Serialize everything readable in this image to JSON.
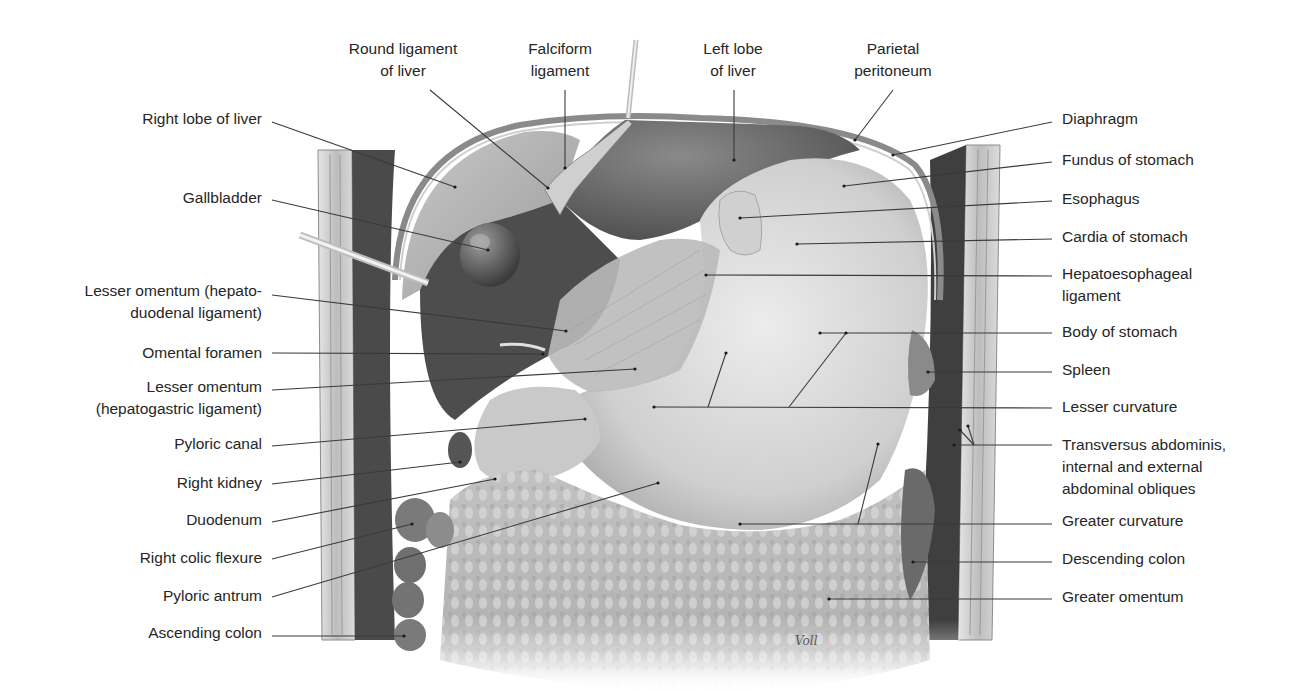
{
  "figure": {
    "signature": "Voll",
    "colors": {
      "background": "#ffffff",
      "label_text": "#262626",
      "leader_line": "#3a3a3a",
      "wall_light": "#d9d9d9",
      "wall_dark": "#3c3c3c",
      "liver": "#9a9a9a",
      "liver_dark": "#4a4a4a",
      "stomach": "#d4d4d4",
      "omentum": "#bdbdbd",
      "colon": "#6e6e6e"
    }
  },
  "labels": {
    "top": [
      {
        "id": "round-ligament-of-liver",
        "lines": [
          "Round ligament",
          "of liver"
        ],
        "x": 403,
        "y": 38,
        "anchor": [
          430,
          90
        ],
        "target": [
          548,
          188
        ]
      },
      {
        "id": "falciform-ligament",
        "lines": [
          "Falciform",
          "ligament"
        ],
        "x": 560,
        "y": 38,
        "anchor": [
          565,
          90
        ],
        "target": [
          565,
          168
        ]
      },
      {
        "id": "left-lobe-of-liver",
        "lines": [
          "Left lobe",
          "of liver"
        ],
        "x": 733,
        "y": 38,
        "anchor": [
          734,
          90
        ],
        "target": [
          734,
          160
        ]
      },
      {
        "id": "parietal-peritoneum",
        "lines": [
          "Parietal",
          "peritoneum"
        ],
        "x": 893,
        "y": 38,
        "anchor": [
          893,
          90
        ],
        "target": [
          855,
          140
        ]
      }
    ],
    "left": [
      {
        "id": "right-lobe-of-liver",
        "lines": [
          "Right lobe of liver"
        ],
        "right": 262,
        "y": 108,
        "anchor": [
          272,
          122
        ],
        "target": [
          455,
          187
        ]
      },
      {
        "id": "gallbladder",
        "lines": [
          "Gallbladder"
        ],
        "right": 262,
        "y": 187,
        "anchor": [
          272,
          200
        ],
        "target": [
          488,
          250
        ]
      },
      {
        "id": "lesser-omentum-hepatoduodenal",
        "lines": [
          "Lesser omentum (hepato-",
          "duodenal ligament)"
        ],
        "right": 262,
        "y": 280,
        "anchor": [
          272,
          295
        ],
        "target": [
          566,
          331
        ]
      },
      {
        "id": "omental-foramen",
        "lines": [
          "Omental foramen"
        ],
        "right": 262,
        "y": 342,
        "anchor": [
          272,
          353
        ],
        "target": [
          543,
          354
        ]
      },
      {
        "id": "lesser-omentum-hepatogastric",
        "lines": [
          "Lesser omentum",
          "(hepatogastric ligament)"
        ],
        "right": 262,
        "y": 376,
        "anchor": [
          272,
          390
        ],
        "target": [
          635,
          369
        ]
      },
      {
        "id": "pyloric-canal",
        "lines": [
          "Pyloric canal"
        ],
        "right": 262,
        "y": 433,
        "anchor": [
          272,
          446
        ],
        "target": [
          585,
          419
        ]
      },
      {
        "id": "right-kidney",
        "lines": [
          "Right kidney"
        ],
        "right": 262,
        "y": 472,
        "anchor": [
          272,
          484
        ],
        "target": [
          460,
          462
        ]
      },
      {
        "id": "duodenum",
        "lines": [
          "Duodenum"
        ],
        "right": 262,
        "y": 509,
        "anchor": [
          272,
          522
        ],
        "target": [
          495,
          479
        ]
      },
      {
        "id": "right-colic-flexure",
        "lines": [
          "Right colic flexure"
        ],
        "right": 262,
        "y": 547,
        "anchor": [
          272,
          559
        ],
        "target": [
          412,
          524
        ]
      },
      {
        "id": "pyloric-antrum",
        "lines": [
          "Pyloric antrum"
        ],
        "right": 262,
        "y": 585,
        "anchor": [
          272,
          597
        ],
        "target": [
          658,
          483
        ]
      },
      {
        "id": "ascending-colon",
        "lines": [
          "Ascending colon"
        ],
        "right": 262,
        "y": 622,
        "anchor": [
          272,
          636
        ],
        "target": [
          404,
          636
        ]
      }
    ],
    "right": [
      {
        "id": "diaphragm",
        "lines": [
          "Diaphragm"
        ],
        "x": 1062,
        "y": 108,
        "anchor": [
          1052,
          122
        ],
        "target": [
          893,
          155
        ]
      },
      {
        "id": "fundus-of-stomach",
        "lines": [
          "Fundus of stomach"
        ],
        "x": 1062,
        "y": 149,
        "anchor": [
          1052,
          162
        ],
        "target": [
          844,
          186
        ]
      },
      {
        "id": "esophagus",
        "lines": [
          "Esophagus"
        ],
        "x": 1062,
        "y": 188,
        "anchor": [
          1052,
          201
        ],
        "target": [
          740,
          218
        ]
      },
      {
        "id": "cardia-of-stomach",
        "lines": [
          "Cardia of stomach"
        ],
        "x": 1062,
        "y": 226,
        "anchor": [
          1052,
          239
        ],
        "target": [
          797,
          244
        ]
      },
      {
        "id": "hepatoesophageal-ligament",
        "lines": [
          "Hepatoesophageal",
          "ligament"
        ],
        "x": 1062,
        "y": 263,
        "anchor": [
          1052,
          276
        ],
        "target": [
          706,
          275
        ]
      },
      {
        "id": "body-of-stomach",
        "lines": [
          "Body of stomach"
        ],
        "x": 1062,
        "y": 321,
        "anchor": [
          1052,
          333
        ],
        "target": [
          820,
          333
        ]
      },
      {
        "id": "spleen",
        "lines": [
          "Spleen"
        ],
        "x": 1062,
        "y": 359,
        "anchor": [
          1052,
          372
        ],
        "target": [
          928,
          372
        ]
      },
      {
        "id": "lesser-curvature",
        "lines": [
          "Lesser curvature"
        ],
        "x": 1062,
        "y": 396,
        "anchor": [
          1052,
          408
        ],
        "target": [
          654,
          407
        ]
      },
      {
        "id": "transversus-abdominis-obliques",
        "lines": [
          "Transversus abdominis,",
          "internal and external",
          "abdominal obliques"
        ],
        "x": 1062,
        "y": 434,
        "anchor": [
          1052,
          445
        ],
        "target": [
          954,
          445
        ]
      },
      {
        "id": "greater-curvature",
        "lines": [
          "Greater curvature"
        ],
        "x": 1062,
        "y": 510,
        "anchor": [
          1052,
          524
        ],
        "target": [
          740,
          524
        ]
      },
      {
        "id": "descending-colon",
        "lines": [
          "Descending colon"
        ],
        "x": 1062,
        "y": 548,
        "anchor": [
          1052,
          562
        ],
        "target": [
          913,
          562
        ]
      },
      {
        "id": "greater-omentum",
        "lines": [
          "Greater omentum"
        ],
        "x": 1062,
        "y": 586,
        "anchor": [
          1052,
          599
        ],
        "target": [
          829,
          599
        ]
      }
    ]
  },
  "extra_leaders": [
    {
      "from": [
        708,
        407
      ],
      "to": [
        726,
        353
      ],
      "of": "lesser-curvature"
    },
    {
      "from": [
        789,
        407
      ],
      "to": [
        846,
        333
      ],
      "of": "body-of-stomach-branch"
    },
    {
      "from": [
        858,
        524
      ],
      "to": [
        878,
        444
      ],
      "of": "greater-curvature"
    },
    {
      "from": [
        974,
        445
      ],
      "to": [
        960,
        430
      ],
      "of": "transversus-abdominis-obliques"
    },
    {
      "from": [
        974,
        445
      ],
      "to": [
        968,
        426
      ],
      "of": "transversus-abdominis-obliques"
    }
  ]
}
